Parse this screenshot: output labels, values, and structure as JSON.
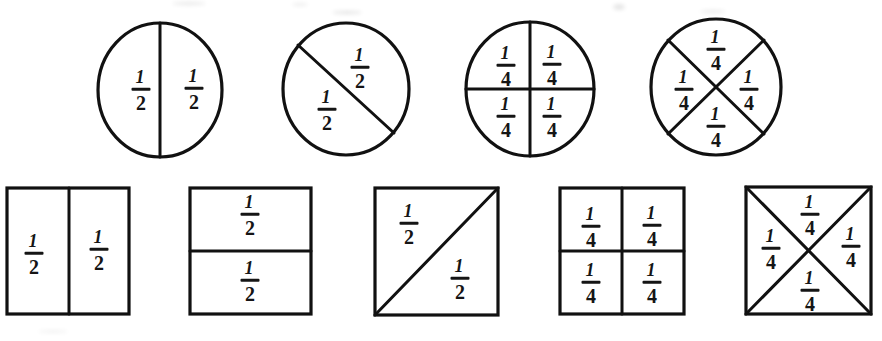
{
  "figure": {
    "background_color": "#ffffff",
    "ink_color": "#111111",
    "width": 882,
    "height": 341,
    "rows": [
      {
        "name": "circle-row",
        "shape": "circle",
        "figures": [
          {
            "id": "circle-vertical-halves",
            "description": "circle split by a vertical line into two halves",
            "denominator": 2,
            "parts": 2,
            "labels": [
              "1/2",
              "1/2"
            ]
          },
          {
            "id": "circle-diagonal-halves",
            "description": "circle split by a diagonal line into two halves",
            "denominator": 2,
            "parts": 2,
            "labels": [
              "1/2",
              "1/2"
            ]
          },
          {
            "id": "circle-cross-fourths",
            "description": "circle split by vertical and horizontal lines into four quarters",
            "denominator": 4,
            "parts": 4,
            "labels": [
              "1/4",
              "1/4",
              "1/4",
              "1/4"
            ]
          },
          {
            "id": "circle-x-fourths",
            "description": "circle split by two diagonal lines into four wedges",
            "denominator": 4,
            "parts": 4,
            "labels": [
              "1/4",
              "1/4",
              "1/4",
              "1/4"
            ]
          }
        ]
      },
      {
        "name": "square-row",
        "shape": "square",
        "figures": [
          {
            "id": "square-vertical-halves",
            "description": "rectangle split by a vertical line into two halves",
            "denominator": 2,
            "parts": 2,
            "labels": [
              "1/2",
              "1/2"
            ]
          },
          {
            "id": "square-horizontal-halves",
            "description": "square split by a horizontal line into two halves",
            "denominator": 2,
            "parts": 2,
            "labels": [
              "1/2",
              "1/2"
            ]
          },
          {
            "id": "square-diagonal-halves",
            "description": "square split by a diagonal line into two triangles",
            "denominator": 2,
            "parts": 2,
            "labels": [
              "1/2",
              "1/2"
            ]
          },
          {
            "id": "square-cross-fourths",
            "description": "square split into four equal quadrants",
            "denominator": 4,
            "parts": 4,
            "labels": [
              "1/4",
              "1/4",
              "1/4",
              "1/4"
            ]
          },
          {
            "id": "square-x-fourths",
            "description": "square split by both diagonals into four triangles",
            "denominator": 4,
            "parts": 4,
            "labels": [
              "1/4",
              "1/4",
              "1/4",
              "1/4"
            ]
          }
        ]
      }
    ],
    "fractions": {
      "half": {
        "numerator": "1",
        "denominator": "2"
      },
      "fourth": {
        "numerator": "1",
        "denominator": "4"
      }
    }
  }
}
